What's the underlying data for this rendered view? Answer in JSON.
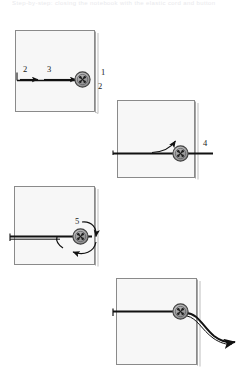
{
  "figure": {
    "caption": "Step-by-step: closing the notebook with the elastic cord and button",
    "background_color": "#ffffff",
    "cord_color": "#111111",
    "book_face_color": "#f7f7f7",
    "book_outline_color": "#8a8a8a",
    "button_fill_color": "#9a9a9a",
    "button_edge_color": "#3a3a3a",
    "label_color": "#1a1a1a"
  },
  "panels": [
    {
      "id": "panel-1",
      "name": "step-one-pull-cord-across",
      "labels": [
        {
          "id": "label-2-left",
          "text": "2",
          "x": 24,
          "y": 68
        },
        {
          "id": "label-3",
          "text": "3",
          "x": 48,
          "y": 68
        },
        {
          "id": "label-1-right",
          "text": "1",
          "x": 101,
          "y": 72
        },
        {
          "id": "label-2-right",
          "text": "2",
          "x": 99,
          "y": 85
        }
      ]
    },
    {
      "id": "panel-2",
      "name": "step-two-hook-cord-up-over-button",
      "labels": [
        {
          "id": "label-4",
          "text": "4",
          "x": 203,
          "y": 143
        }
      ]
    },
    {
      "id": "panel-3",
      "name": "step-three-loop-cord-around-button",
      "labels": [
        {
          "id": "label-5",
          "text": "5",
          "x": 76,
          "y": 221
        }
      ]
    },
    {
      "id": "panel-4",
      "name": "step-four-tail-hangs-free",
      "labels": []
    }
  ]
}
